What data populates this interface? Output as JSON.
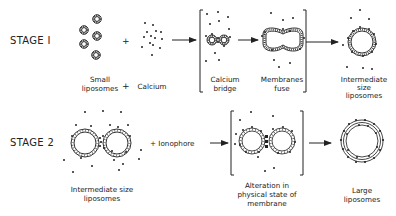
{
  "diagram": {
    "stage1": {
      "label": "STAGE I",
      "plus": "+",
      "captions": {
        "small_l1": "Small",
        "small_l2": "liposomes",
        "plus_text": "+",
        "calcium": "Calcium",
        "bridge_l1": "Calcium",
        "bridge_l2": "bridge",
        "fuse_l1": "Membranes",
        "fuse_l2": "fuse",
        "inter_l1": "Intermediate",
        "inter_l2": "size",
        "inter_l3": "liposomes"
      }
    },
    "stage2": {
      "label": "STAGE 2",
      "plus_ionophore": "+ Ionophore",
      "captions": {
        "inter_l1": "Intermediate size",
        "inter_l2": "liposomes",
        "alter_l1": "Alteration in",
        "alter_l2": "physical state of",
        "alter_l3": "membrane",
        "large_l1": "Large",
        "large_l2": "liposomes"
      }
    },
    "colors": {
      "ink": "#222222",
      "background": "#ffffff"
    }
  }
}
